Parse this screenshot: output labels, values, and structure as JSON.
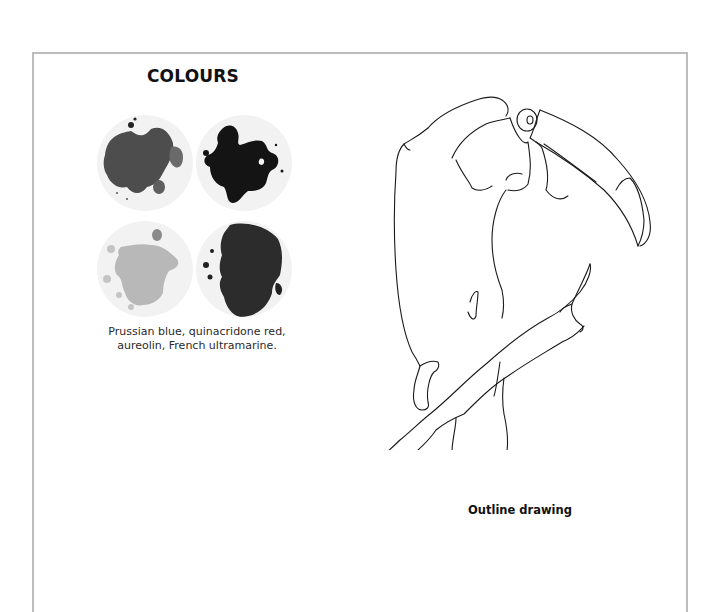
{
  "colours_section": {
    "title": "COLOURS",
    "swatches": [
      {
        "name": "Prussian blue",
        "tone": "#4a4a4a"
      },
      {
        "name": "quinacridone red",
        "tone": "#141414"
      },
      {
        "name": "aureolin",
        "tone": "#b8b8b8"
      },
      {
        "name": "French ultramarine",
        "tone": "#2a2a2a"
      }
    ],
    "caption_line1": "Prussian blue, quinacridone red,",
    "caption_line2": "aureolin, French ultramarine."
  },
  "drawing_section": {
    "subject": "toucan perched on branch",
    "label": "Outline drawing"
  },
  "colors": {
    "frame_border": "#bdbdbd",
    "text": "#111111",
    "background": "#ffffff"
  }
}
